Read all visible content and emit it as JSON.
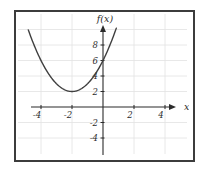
{
  "figure": {
    "xlabel": "x",
    "ylabel": "f(x)"
  },
  "chart_data": {
    "type": "line",
    "title": "",
    "xlabel": "x",
    "ylabel": "f(x)",
    "function": "f(x) = (x+2)^2 + 2",
    "series": [
      {
        "name": "f(x)",
        "expression": "(x+2)^2+2",
        "x_start": -4.82,
        "x_end": 0.88,
        "points": [
          [
            -4.8,
            9.84
          ],
          [
            -4,
            6
          ],
          [
            -3,
            3
          ],
          [
            -2,
            2
          ],
          [
            -1,
            3
          ],
          [
            0,
            6
          ],
          [
            0.85,
            10.12
          ]
        ]
      }
    ],
    "vertex": [
      -2,
      2
    ],
    "y_intercept": [
      0,
      6
    ],
    "x_ticks": [
      -4,
      -2,
      2,
      4
    ],
    "y_ticks": [
      8,
      6,
      4,
      2,
      -2,
      -4
    ],
    "x_tick_labels": [
      "-4",
      "-2",
      "2",
      "4"
    ],
    "y_tick_labels": [
      "8",
      "6",
      "4",
      "2",
      "-2",
      "-4"
    ],
    "grid_x_values": [
      -4,
      -2,
      2,
      4
    ],
    "grid_y_values": [
      10,
      8,
      6,
      4,
      2,
      -2,
      -4
    ],
    "xlim": [
      -4.9,
      5.3
    ],
    "ylim": [
      -6.3,
      10.4
    ],
    "grid": true,
    "legend": "none",
    "colors": {
      "curve": "#3f3f3f",
      "axis": "#2b2b2b",
      "grid": "#e2e2e2",
      "frame": "#3c3c3c",
      "background": "#ffffff",
      "label": "#2b2b2b"
    }
  }
}
